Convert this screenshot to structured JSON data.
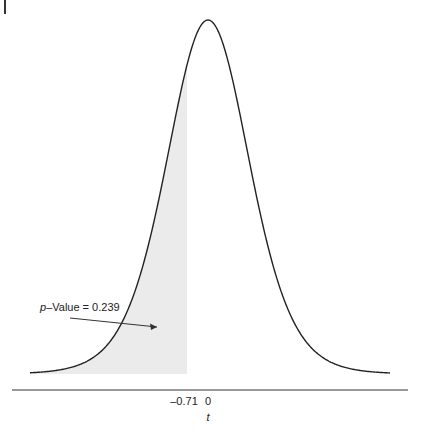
{
  "chart_data": {
    "type": "area",
    "title": "",
    "distribution": "t",
    "xlabel": "t",
    "ylabel": "",
    "tick_labels": [
      "-0.71",
      "0"
    ],
    "tick_values": [
      -0.71,
      0
    ],
    "shaded_region": {
      "from": "-inf",
      "to": -0.71,
      "color": "#ebebeb"
    },
    "annotation": {
      "text_italic": "p",
      "text": "–Value = 0.239",
      "p_value": 0.239
    },
    "grid": false,
    "legend": null,
    "geometry": {
      "center_x": 208,
      "peak_y": 20,
      "baseline_y": 374,
      "px_per_t": 30,
      "shade_right_x": 187,
      "curve_x_min": 30,
      "curve_x_max": 390,
      "axis_y": 390,
      "axis_x_min": 12,
      "axis_x_max": 408,
      "df": 10,
      "scale_px": 42
    }
  },
  "labels": {
    "tick_neg": "–0.71",
    "tick_zero": "0",
    "x_axis": "t",
    "p_italic": "p",
    "p_rest": "–Value = 0.239"
  }
}
